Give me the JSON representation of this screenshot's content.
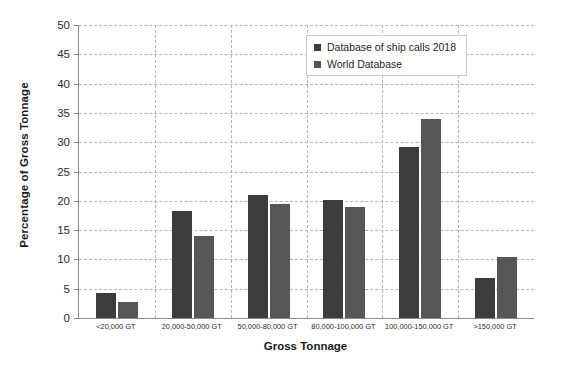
{
  "chart_data": {
    "type": "bar",
    "title": "",
    "xlabel": "Gross Tonnage",
    "ylabel": "Percentage of Gross Tonnage",
    "categories": [
      "<20,000 GT",
      "20,000-50,000 GT",
      "50,000-80,000 GT",
      "80,000-100,000 GT",
      "100,000-150,000 GT",
      ">150,000 GT"
    ],
    "series": [
      {
        "name": "Database of ship calls 2018",
        "color": "#3c3c3c",
        "values": [
          4.3,
          18.2,
          21.0,
          20.2,
          29.2,
          6.9
        ]
      },
      {
        "name": "World Database",
        "color": "#565656",
        "values": [
          2.8,
          14.0,
          19.4,
          19.0,
          34.0,
          10.4
        ]
      }
    ],
    "ylim": [
      0,
      50
    ],
    "ytick_values": [
      0,
      5,
      10,
      15,
      20,
      25,
      30,
      35,
      40,
      45,
      50
    ],
    "ytick_labels": [
      "0",
      "5",
      "10",
      "15",
      "20",
      "25",
      "30",
      "35",
      "40",
      "45",
      "50"
    ],
    "grid": {
      "horizontal": true,
      "vertical": true,
      "style": "dashed",
      "color": "#b4b4b4"
    },
    "legend": {
      "position": "upper-center-right",
      "entries": [
        "Database of ship calls 2018",
        "World Database"
      ]
    },
    "axis_color": "#8a8a8a",
    "background": "#ffffff"
  }
}
